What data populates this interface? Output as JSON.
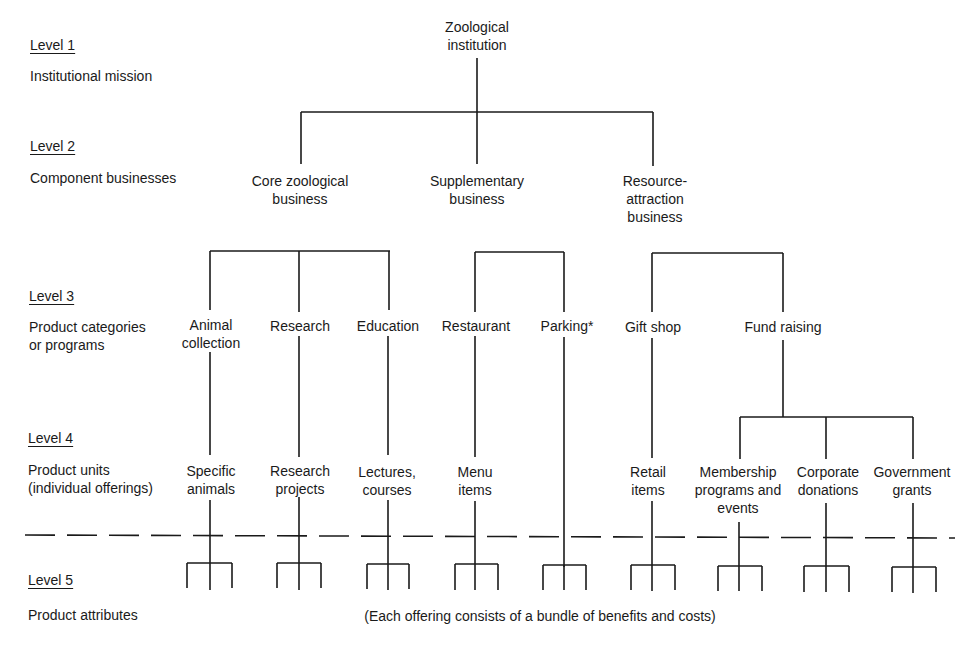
{
  "levels": [
    {
      "title": "Level 1",
      "description": "Institutional mission"
    },
    {
      "title": "Level 2",
      "description": "Component businesses"
    },
    {
      "title": "Level 3",
      "description": "Product categories\nor programs"
    },
    {
      "title": "Level 4",
      "description": "Product units\n(individual offerings)"
    },
    {
      "title": "Level 5",
      "description": "Product attributes"
    }
  ],
  "root": {
    "label": "Zoological\ninstitution"
  },
  "businesses": [
    {
      "label": "Core zoological\nbusiness"
    },
    {
      "label": "Supplementary\nbusiness"
    },
    {
      "label": "Resource-\nattraction\nbusiness"
    }
  ],
  "categories": [
    {
      "label": "Animal\ncollection"
    },
    {
      "label": "Research"
    },
    {
      "label": "Education"
    },
    {
      "label": "Restaurant"
    },
    {
      "label": "Parking*"
    },
    {
      "label": "Gift shop"
    },
    {
      "label": "Fund raising"
    }
  ],
  "units": [
    {
      "label": "Specific\nanimals"
    },
    {
      "label": "Research\nprojects"
    },
    {
      "label": "Lectures,\ncourses"
    },
    {
      "label": "Menu\nitems"
    },
    {
      "label": "Retail\nitems"
    },
    {
      "label": "Membership\nprograms and\nevents"
    },
    {
      "label": "Corporate\ndonations"
    },
    {
      "label": "Government\ngrants"
    }
  ],
  "attributes_note": "(Each offering consists of a bundle of benefits and costs)"
}
